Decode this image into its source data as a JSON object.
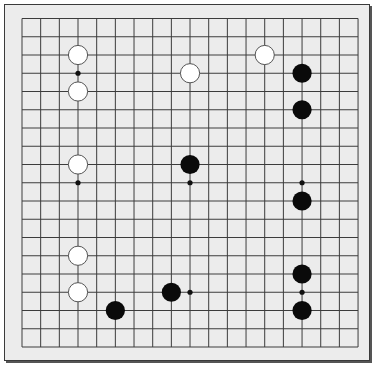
{
  "board": {
    "size": 19,
    "origin_x": 22,
    "origin_y": 18.5,
    "spacing_x": 18.67,
    "spacing_y": 18.25,
    "stone_radius": 9.6,
    "colors": {
      "background": "#ececec",
      "line": "#3c3c3c",
      "black_stone": "#0a0a0a",
      "white_stone": "#ffffff",
      "white_stone_outline": "#555555",
      "star_point": "#111111"
    }
  },
  "star_points": [
    [
      3,
      3
    ],
    [
      3,
      9
    ],
    [
      9,
      9
    ],
    [
      15,
      9
    ],
    [
      9,
      15
    ],
    [
      15,
      15
    ]
  ],
  "stones": {
    "white": [
      [
        3,
        2
      ],
      [
        3,
        4
      ],
      [
        9,
        3
      ],
      [
        13,
        2
      ],
      [
        3,
        8
      ],
      [
        3,
        13
      ],
      [
        3,
        15
      ]
    ],
    "black": [
      [
        15,
        3
      ],
      [
        15,
        5
      ],
      [
        9,
        8
      ],
      [
        15,
        10
      ],
      [
        15,
        14
      ],
      [
        15,
        16
      ],
      [
        8,
        15
      ],
      [
        5,
        16
      ]
    ]
  }
}
